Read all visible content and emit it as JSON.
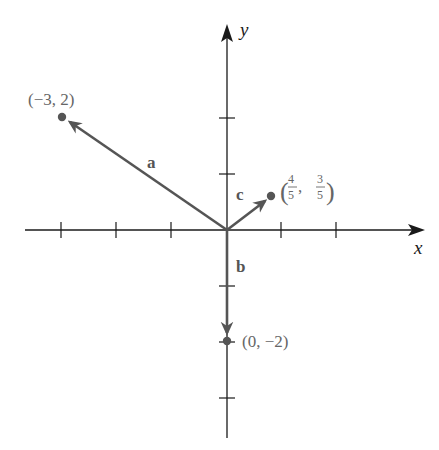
{
  "diagram": {
    "type": "vector-plot",
    "axes": {
      "x_label": "x",
      "y_label": "y",
      "x_ticks": [
        -3,
        -2,
        -1,
        1,
        2
      ],
      "y_ticks": [
        2,
        1,
        -1,
        -2,
        -3
      ],
      "colors": {
        "axis": "#1a1a1a",
        "vector": "#555555",
        "label": "#666666"
      }
    },
    "vectors": [
      {
        "name": "a",
        "from": [
          0,
          0
        ],
        "to": [
          -3,
          2
        ],
        "endpoint_label": "(−3, 2)"
      },
      {
        "name": "b",
        "from": [
          0,
          0
        ],
        "to": [
          0,
          -2
        ],
        "endpoint_label": "(0, −2)"
      },
      {
        "name": "c",
        "from": [
          0,
          0
        ],
        "to": [
          0.8,
          0.6
        ],
        "endpoint_label": "(4/5, 3/5)",
        "endpoint_label_parts": {
          "open": "(",
          "x_num": "4",
          "x_den": "5",
          "comma": ",",
          "y_num": "3",
          "y_den": "5",
          "close": ")"
        }
      }
    ]
  },
  "labels": {
    "x_axis": "x",
    "y_axis": "y",
    "vec_a": "a",
    "vec_b": "b",
    "vec_c": "c",
    "point_a": "(−3, 2)",
    "point_b": "(0, −2)",
    "point_c_open": "(",
    "point_c_xnum": "4",
    "point_c_xden": "5",
    "point_c_comma": ",",
    "point_c_ynum": "3",
    "point_c_yden": "5",
    "point_c_close": ")"
  }
}
